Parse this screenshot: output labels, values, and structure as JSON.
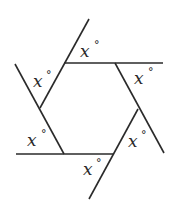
{
  "diagram": {
    "line_color": "#2a2a2a",
    "background": "#ffffff",
    "angle_labels": [
      {
        "id": "top",
        "var": "x",
        "unit": "°"
      },
      {
        "id": "upper-right",
        "var": "x",
        "unit": "°"
      },
      {
        "id": "upper-left",
        "var": "x",
        "unit": "°"
      },
      {
        "id": "lower-left",
        "var": "x",
        "unit": "°"
      },
      {
        "id": "lower-right",
        "var": "x",
        "unit": "°"
      },
      {
        "id": "bottom",
        "var": "x",
        "unit": "°"
      }
    ],
    "hexagon_vertices": [
      {
        "name": "top-left",
        "x": 64,
        "y": 63
      },
      {
        "name": "top-right",
        "x": 115,
        "y": 63
      },
      {
        "name": "right",
        "x": 138,
        "y": 109
      },
      {
        "name": "bottom-right",
        "x": 114,
        "y": 154
      },
      {
        "name": "bottom-left",
        "x": 64,
        "y": 154
      },
      {
        "name": "left",
        "x": 40,
        "y": 108
      }
    ]
  }
}
